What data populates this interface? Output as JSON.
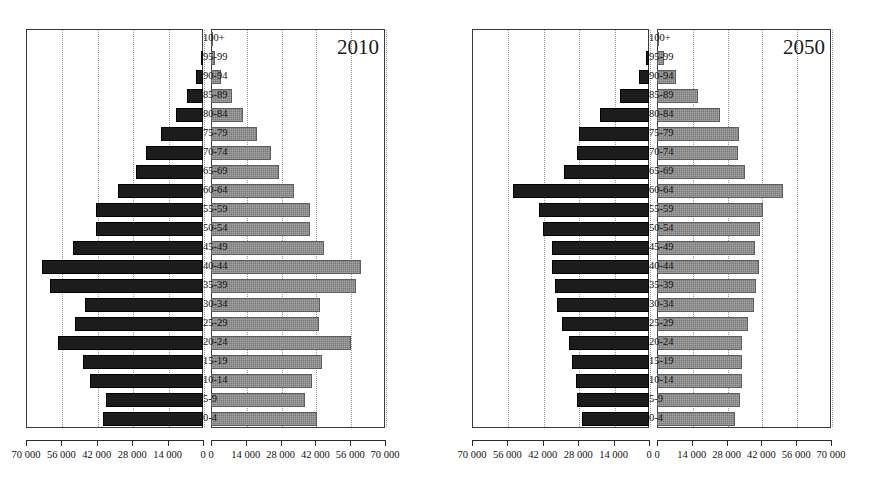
{
  "chart_data": {
    "type": "bar",
    "subtype": "population-pyramid",
    "title": "",
    "xlabel": "",
    "ylabel": "",
    "grid": true,
    "legend_position": "none",
    "xlim": [
      0,
      70000
    ],
    "xticks": [
      "0",
      "14000",
      "28000",
      "42000",
      "56000",
      "70000"
    ],
    "xticklabels_left": [
      "70 000",
      "56 000",
      "42 000",
      "28 000",
      "14 000",
      "0"
    ],
    "xticklabels_right": [
      "0",
      "14 000",
      "28 000",
      "42 000",
      "56 000",
      "70 000"
    ],
    "categories": [
      "100+",
      "95-99",
      "90-94",
      "85-89",
      "80-84",
      "75-79",
      "70-74",
      "65-69",
      "60-64",
      "55-59",
      "50-54",
      "45-49",
      "40-44",
      "35-39",
      "30-34",
      "25-29",
      "20-24",
      "15-19",
      "10-14",
      "5-9",
      "0-4"
    ],
    "panels": [
      {
        "label": "2010",
        "series": [
          {
            "name": "male",
            "side": "left",
            "values": [
              200,
              900,
              2600,
              6200,
              10500,
              16500,
              22500,
              26500,
              33500,
              42500,
              42500,
              51500,
              63500,
              60500,
              46500,
              50500,
              57500,
              47500,
              44500,
              38500,
              39500
            ]
          },
          {
            "name": "female",
            "side": "right",
            "values": [
              400,
              1600,
              4200,
              8500,
              13000,
              18500,
              24000,
              27500,
              33500,
              40000,
              40000,
              45500,
              60500,
              58500,
              44000,
              43500,
              56500,
              44500,
              40500,
              38000,
              42500
            ]
          }
        ]
      },
      {
        "label": "2050",
        "series": [
          {
            "name": "male",
            "side": "left",
            "values": [
              100,
              1200,
              4000,
              11500,
              19500,
              27500,
              28500,
              33500,
              53800,
              43500,
              42000,
              38500,
              38500,
              37000,
              36500,
              34500,
              31500,
              30500,
              29000,
              28500,
              26500
            ]
          },
          {
            "name": "female",
            "side": "right",
            "values": [
              600,
              3000,
              7500,
              16500,
              25500,
              33000,
              32500,
              35500,
              50500,
              42500,
              41500,
              39500,
              41000,
              40000,
              39000,
              36500,
              34000,
              34000,
              34000,
              33500,
              31500
            ]
          }
        ]
      }
    ]
  }
}
